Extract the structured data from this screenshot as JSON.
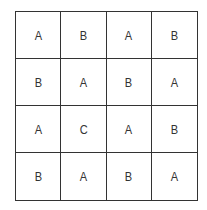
{
  "grid": {
    "rows": 4,
    "cols": 4,
    "cells": [
      [
        "A",
        "B",
        "A",
        "B"
      ],
      [
        "B",
        "A",
        "B",
        "A"
      ],
      [
        "A",
        "C",
        "A",
        "B"
      ],
      [
        "B",
        "A",
        "B",
        "A"
      ]
    ]
  }
}
